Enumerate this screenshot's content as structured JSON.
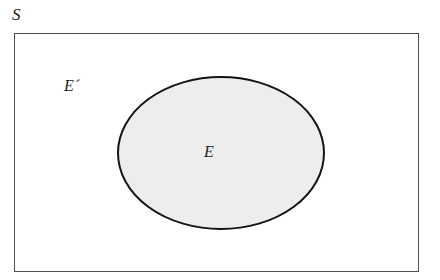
{
  "diagram": {
    "type": "venn-set-diagram",
    "background_color": "#ffffff"
  },
  "universal_set": {
    "label": "S",
    "shape": "rectangle",
    "x": 14,
    "y": 33,
    "width": 405,
    "height": 239,
    "fill_color": "#ffffff",
    "stroke_color": "#555555",
    "stroke_width": 1.2,
    "label_x": 12,
    "label_y": 6
  },
  "event_set": {
    "label": "E",
    "shape": "ellipse",
    "center_x": 221,
    "center_y": 153,
    "radius_x": 103,
    "radius_y": 76,
    "fill_color": "#ededed",
    "stroke_color": "#111111",
    "stroke_width": 2,
    "label_x": 204,
    "label_y": 144
  },
  "complement_set": {
    "label": "E´",
    "region": "inside-rectangle-outside-ellipse",
    "fill_color": "#ffffff",
    "label_x": 64,
    "label_y": 78
  }
}
